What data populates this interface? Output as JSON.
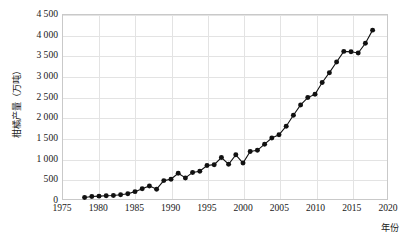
{
  "chart_data": {
    "type": "line",
    "title": "",
    "subtitle": "",
    "xlabel": "年份",
    "ylabel": "柑橘产量（万吨）",
    "xlim": [
      1975,
      2020
    ],
    "ylim": [
      0,
      4500
    ],
    "xticks": [
      1975,
      1980,
      1985,
      1990,
      1995,
      2000,
      2005,
      2010,
      2015,
      2020
    ],
    "xtick_labels": [
      "1975",
      "1980",
      "1985",
      "1990",
      "1995",
      "2000",
      "2005",
      "2010",
      "2015",
      "2020"
    ],
    "yticks": [
      0,
      500,
      1000,
      1500,
      2000,
      2500,
      3000,
      3500,
      4000,
      4500
    ],
    "ytick_labels": [
      "0",
      "500",
      "1 000",
      "1 500",
      "2 000",
      "2 500",
      "3 000",
      "3 500",
      "4 000",
      "4 500"
    ],
    "grid": true,
    "legend": null,
    "marker": "filled-circle",
    "marker_color": "#111111",
    "line_color": "#111111",
    "x": [
      1978,
      1979,
      1980,
      1981,
      1982,
      1983,
      1984,
      1985,
      1986,
      1987,
      1988,
      1989,
      1990,
      1991,
      1992,
      1993,
      1994,
      1995,
      1996,
      1997,
      1998,
      1999,
      2000,
      2001,
      2002,
      2003,
      2004,
      2005,
      2006,
      2007,
      2008,
      2009,
      2010,
      2011,
      2012,
      2013,
      2014,
      2015,
      2016,
      2017,
      2018
    ],
    "values": [
      38,
      60,
      70,
      78,
      85,
      105,
      130,
      180,
      250,
      320,
      240,
      450,
      485,
      630,
      515,
      650,
      680,
      820,
      840,
      1015,
      850,
      1080,
      880,
      1160,
      1190,
      1340,
      1490,
      1570,
      1780,
      2050,
      2300,
      2480,
      2560,
      2850,
      3090,
      3350,
      3610,
      3600,
      3570,
      3810,
      4130
    ],
    "series": [
      {
        "name": "柑橘产量",
        "x": [
          1978,
          1979,
          1980,
          1981,
          1982,
          1983,
          1984,
          1985,
          1986,
          1987,
          1988,
          1989,
          1990,
          1991,
          1992,
          1993,
          1994,
          1995,
          1996,
          1997,
          1998,
          1999,
          2000,
          2001,
          2002,
          2003,
          2004,
          2005,
          2006,
          2007,
          2008,
          2009,
          2010,
          2011,
          2012,
          2013,
          2014,
          2015,
          2016,
          2017,
          2018
        ],
        "values": [
          38,
          60,
          70,
          78,
          85,
          105,
          130,
          180,
          250,
          320,
          240,
          450,
          485,
          630,
          515,
          650,
          680,
          820,
          840,
          1015,
          850,
          1080,
          880,
          1160,
          1190,
          1340,
          1490,
          1570,
          1780,
          2050,
          2300,
          2480,
          2560,
          2850,
          3090,
          3350,
          3610,
          3600,
          3570,
          3810,
          4130
        ]
      }
    ]
  },
  "axis": {
    "y_title": "柑橘产量（万吨）",
    "x_title": "年份"
  }
}
